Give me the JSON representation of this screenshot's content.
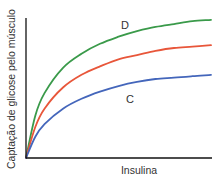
{
  "chart_data": {
    "type": "line",
    "title": "",
    "xlabel": "Insulina",
    "ylabel": "Captação de glicose pelo músculo",
    "axis_ticks": "none",
    "grid": false,
    "legend": "none (inline curve labels)",
    "x": [
      0,
      0.05,
      0.1,
      0.2,
      0.3,
      0.4,
      0.5,
      0.6,
      0.7,
      0.8,
      0.9,
      1.0
    ],
    "series": [
      {
        "name": "D",
        "color": "#3a9a4a",
        "label": "D",
        "values": [
          0,
          0.3,
          0.46,
          0.64,
          0.74,
          0.81,
          0.86,
          0.9,
          0.93,
          0.95,
          0.97,
          0.98
        ]
      },
      {
        "name": "(unlabeled)",
        "color": "#e8563a",
        "label": "",
        "values": [
          0,
          0.22,
          0.35,
          0.5,
          0.59,
          0.65,
          0.7,
          0.73,
          0.76,
          0.78,
          0.79,
          0.8
        ]
      },
      {
        "name": "C",
        "color": "#4466bb",
        "label": "C",
        "values": [
          0,
          0.15,
          0.24,
          0.35,
          0.42,
          0.47,
          0.51,
          0.54,
          0.56,
          0.57,
          0.58,
          0.59
        ]
      }
    ],
    "ylim": [
      0,
      1
    ],
    "xlim": [
      0,
      1
    ]
  },
  "labels": {
    "x_axis": "Insulina",
    "y_axis": "Captação de glicose pelo músculo",
    "curve_d": "D",
    "curve_c": "C"
  }
}
